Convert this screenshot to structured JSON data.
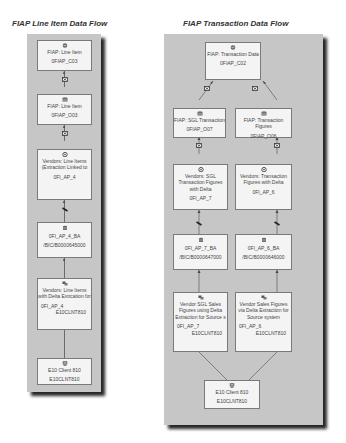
{
  "left_diagram": {
    "title": "FIAP Line Item Data Flow",
    "nodes": [
      {
        "id": "multiprovider",
        "icon": "multiprovider-icon",
        "label": "FIAP: Line Item",
        "tech": "0FIAP_C03"
      },
      {
        "id": "ods",
        "icon": "ods-icon",
        "label": "FIAP: Line Item",
        "tech": "0FIAP_O03"
      },
      {
        "id": "infosource",
        "icon": "infosource-icon",
        "label": "Vendors: Line Items (Extraction Linked to",
        "tech": "0FI_AP_4"
      },
      {
        "id": "datasource-ba",
        "icon": "datasource-table-icon",
        "label": "0FI_AP_4_BA",
        "tech": "/BIC/B0000645000"
      },
      {
        "id": "datasource",
        "icon": "datasource-icon",
        "label": "Vendors: Line Items with Delta Extrcation for",
        "tech": "0FI_AP_4",
        "tech2": "E10CLNT810"
      },
      {
        "id": "source-system",
        "icon": "source-system-icon",
        "label": "E10 Client 810",
        "tech": "E10CLNT810"
      }
    ]
  },
  "right_diagram": {
    "title": "FIAP Transaction Data Flow",
    "nodes": [
      {
        "id": "cube",
        "icon": "infocube-icon",
        "label": "FIAP: Transaction Data",
        "tech": "0FIAP_C02"
      },
      {
        "id": "ods-sgl",
        "icon": "ods-icon",
        "label": "FIAP: SGL Transaction",
        "tech": "0FIAP_O07"
      },
      {
        "id": "ods-fig",
        "icon": "ods-icon",
        "label": "FIAP: Transaction Figures",
        "tech": "0FIAP_O06"
      },
      {
        "id": "is-sgl",
        "icon": "infosource-icon",
        "label": "Vendors: SGL Transaction Figures with Delta",
        "tech": "0FI_AP_7"
      },
      {
        "id": "is-fig",
        "icon": "infosource-icon",
        "label": "Vendors: Transaction Figures with Delta",
        "tech": "0FI_AP_6"
      },
      {
        "id": "ba-7",
        "icon": "datasource-table-icon",
        "label": "0FI_AP_7_BA",
        "tech": "/BIC/B0000647000"
      },
      {
        "id": "ba-6",
        "icon": "datasource-table-icon",
        "label": "0FI_AP_6_BA",
        "tech": "/BIC/B0000646000"
      },
      {
        "id": "ds-7",
        "icon": "datasource-icon",
        "label": "Vendor SGL Sales Figures using Delta Extraction for Source s",
        "tech": "0FI_AP_7",
        "tech2": "E10CLNT810"
      },
      {
        "id": "ds-6",
        "icon": "datasource-icon",
        "label": "Vendor Sales Figures via Delta Extraction for Source system",
        "tech": "0FI_AP_6",
        "tech2": "E10CLNT810"
      },
      {
        "id": "source-system",
        "icon": "source-system-icon",
        "label": "E10 Client 810",
        "tech": "E10CLNT810"
      }
    ]
  },
  "colors": {
    "panel": "#c6c6c6",
    "node": "#f4f4f4",
    "border": "#7a7a7a",
    "text": "#444444"
  }
}
